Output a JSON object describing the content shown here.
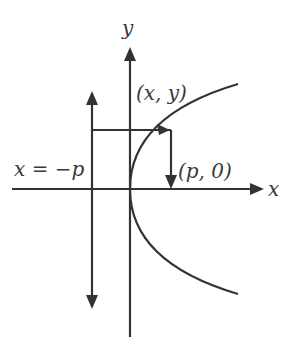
{
  "diagram": {
    "labels": {
      "y_axis": "y",
      "x_axis": "x",
      "point": "(x, y)",
      "focus": "(p, 0)",
      "directrix": "x = −p"
    },
    "colors": {
      "stroke": "#333333",
      "text": "#3a3a3a",
      "background": "#ffffff"
    }
  }
}
